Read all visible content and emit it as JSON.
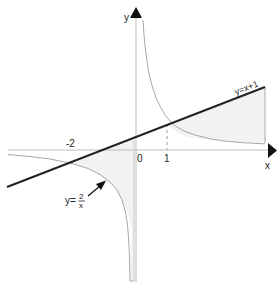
{
  "diagram": {
    "axes": {
      "x_label": "x",
      "y_label": "y",
      "origin_label": "0",
      "tick_labels": [
        "-2",
        "1"
      ]
    },
    "curves": {
      "line_label": "y=x+1",
      "hyperbola_label_prefix": "y=",
      "hyperbola_numerator": "2",
      "hyperbola_denominator": "x"
    },
    "colors": {
      "axis": "#bdbdbd",
      "line": "#222222",
      "curve": "#a8a8a8",
      "shade": "#f2f2f2"
    }
  }
}
